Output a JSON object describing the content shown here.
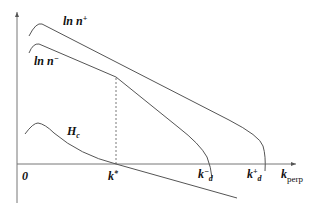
{
  "diagram": {
    "colors": {
      "curve": "#555555",
      "axis": "#666666",
      "text": "#111111",
      "background": "#ffffff"
    },
    "labels": {
      "ln_n_plus": {
        "base": "ln n",
        "sup": "+"
      },
      "ln_n_minus": {
        "base": "ln n",
        "sup": "−"
      },
      "hc": {
        "base": "H",
        "sub": "c"
      },
      "origin": "0",
      "k_star": {
        "base": "k",
        "sup": "*"
      },
      "k_d_minus": {
        "base": "k",
        "sup": "−",
        "sub": "d"
      },
      "k_d_plus": {
        "base": "k",
        "sup": "+",
        "sub": "d"
      },
      "k_perp": {
        "base": "k",
        "sub": "perp"
      }
    },
    "curves": [
      {
        "name": "ln n+",
        "description": "rises to peak near origin, then decreases linearly, bending down to cross axis at k+_d"
      },
      {
        "name": "ln n-",
        "description": "rises to lower peak, decreases linearly, crosses ln n+ above k*, then bends down to cross axis at k-_d"
      },
      {
        "name": "H_c",
        "description": "small peak near origin, decreases and crosses k_perp axis at k*"
      }
    ],
    "annotations": [
      {
        "type": "dashed-vertical-line",
        "at": "k*",
        "from": "axis",
        "to": "intersection of ln n+ and ln n-"
      }
    ]
  }
}
